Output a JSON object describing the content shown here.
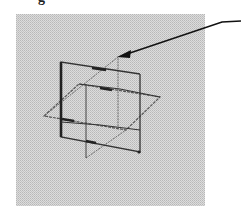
{
  "caption": {
    "fragment": "g"
  },
  "figure": {
    "panel": {
      "x": 16,
      "y": 14,
      "width": 189,
      "height": 192,
      "fill": "#d6d6d6",
      "stipple": "#bdbdbd"
    },
    "colors": {
      "line": "#3a3a3a",
      "line_light": "#6a6a6a",
      "arrow": "#111111"
    },
    "arrow": {
      "label": "pointer-arrow",
      "path": [
        [
          241,
          21
        ],
        [
          222,
          22
        ],
        [
          121,
          56
        ]
      ],
      "tip": [
        117,
        57
      ]
    },
    "planes": [
      {
        "name": "vertical-plane-front",
        "points": [
          [
            61,
            62
          ],
          [
            140,
            74
          ],
          [
            140,
            152
          ],
          [
            61,
            137
          ]
        ]
      },
      {
        "name": "vertical-plane-back",
        "points": [
          [
            86,
            83
          ],
          [
            118,
            57
          ],
          [
            118,
            127
          ],
          [
            86,
            158
          ]
        ]
      },
      {
        "name": "horizontal-plane",
        "points": [
          [
            44,
            116
          ],
          [
            79,
            84
          ],
          [
            160,
            97
          ],
          [
            126,
            130
          ]
        ]
      }
    ]
  }
}
